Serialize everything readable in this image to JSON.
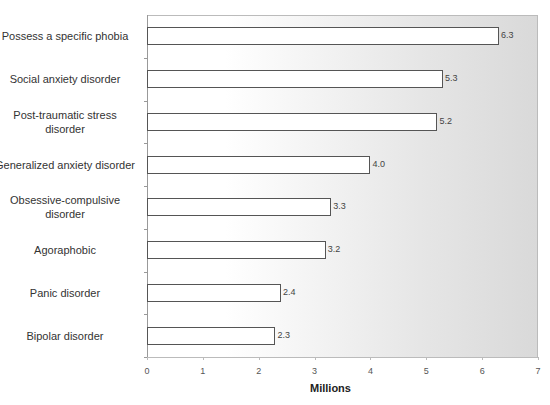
{
  "chart_data": {
    "type": "bar",
    "orientation": "horizontal",
    "title": "",
    "xlabel": "Millions",
    "ylabel": "",
    "xlim": [
      0,
      7
    ],
    "x_ticks": [
      "0",
      "1",
      "2",
      "3",
      "4",
      "5",
      "6",
      "7"
    ],
    "grid": false,
    "legend": null,
    "categories": [
      "Possess a specific phobia",
      "Social anxiety disorder",
      "Post-traumatic stress disorder",
      "Generalized anxiety disorder",
      "Obsessive-compulsive disorder",
      "Agoraphobic",
      "Panic disorder",
      "Bipolar disorder"
    ],
    "values": [
      6.3,
      5.3,
      5.2,
      4.0,
      3.3,
      3.2,
      2.4,
      2.3
    ],
    "value_labels": [
      "6.3",
      "5.3",
      "5.2",
      "4.0",
      "3.3",
      "3.2",
      "2.4",
      "2.3"
    ],
    "category_display": [
      [
        "Possess a specific phobia"
      ],
      [
        "Social anxiety disorder"
      ],
      [
        "Post-traumatic stress",
        "disorder"
      ],
      [
        "Generalized anxiety disorder"
      ],
      [
        "Obsessive-compulsive",
        "disorder"
      ],
      [
        "Agoraphobic"
      ],
      [
        "Panic disorder"
      ],
      [
        "Bipolar disorder"
      ]
    ]
  },
  "colors": {
    "bar_fill": "#ffffff",
    "bar_border": "#555555",
    "plot_bg_left": "#ffffff",
    "plot_bg_right": "#d9d9d9"
  }
}
